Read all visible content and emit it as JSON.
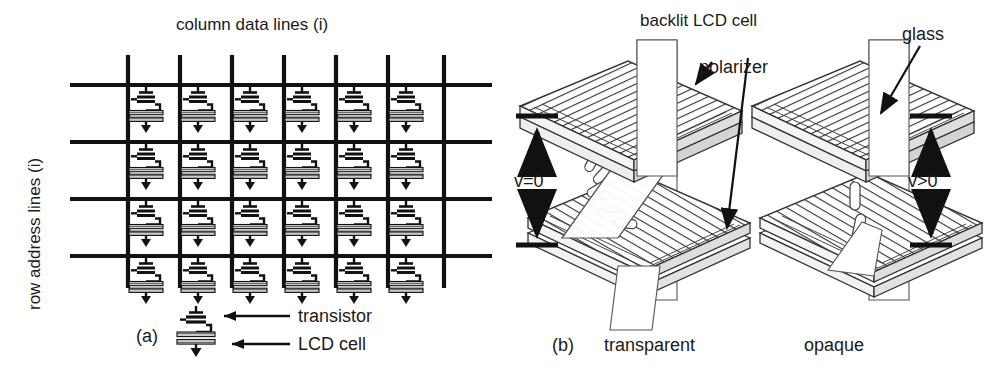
{
  "figure": {
    "background": "#ffffff",
    "ink": "#1a1a1a",
    "fill_gray": "#b8b8b8"
  },
  "panel_a": {
    "tag": "(a)",
    "top_label": "column data lines (i)",
    "side_label": "row address lines (i)",
    "grid": {
      "columns": 7,
      "rows": 4,
      "cells_across": 6,
      "cells_down": 4,
      "col_x": [
        128,
        180,
        232,
        284,
        336,
        388,
        444
      ],
      "row_y": [
        85,
        142,
        199,
        256
      ],
      "row_line_x_start": 70,
      "row_line_x_end": 492,
      "col_line_y_start": 55,
      "col_line_y_end": 288
    },
    "legend": [
      {
        "name": "transistor",
        "label": "transistor"
      },
      {
        "name": "lcd-cell",
        "label": "LCD cell"
      }
    ]
  },
  "panel_b": {
    "tag": "(b)",
    "top_label": "backlit LCD cell",
    "callouts": [
      {
        "name": "polarizer",
        "label": "polarizer"
      },
      {
        "name": "glass",
        "label": "glass"
      }
    ],
    "cells": [
      {
        "name": "transparent-cell",
        "caption": "transparent",
        "voltage": "v=0",
        "voltage_side": "left"
      },
      {
        "name": "opaque-cell",
        "caption": "opaque",
        "voltage": "v>0",
        "voltage_side": "right"
      }
    ]
  }
}
